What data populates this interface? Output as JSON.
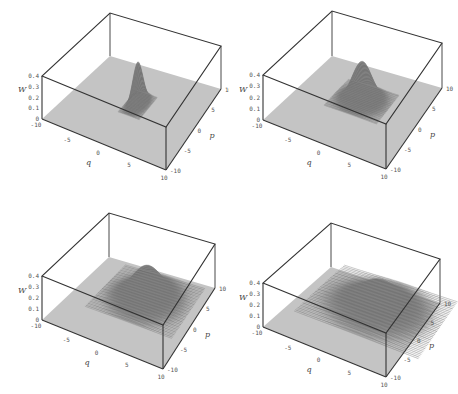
{
  "figure": {
    "panel_count": 4,
    "colors": {
      "floor": "#c4c4c4",
      "peak_dark": "#6e6e6e",
      "peak_mid": "#8a8a8a",
      "edge": "#333333",
      "background": "#ffffff"
    }
  },
  "chart_data": [
    {
      "type": "surface",
      "title": "",
      "xlabel": "q",
      "ylabel": "p",
      "zlabel": "W",
      "xlim": [
        -10,
        10
      ],
      "ylim": [
        -10,
        10
      ],
      "zlim": [
        0,
        0.4
      ],
      "x_ticks": [
        "-10",
        "-5",
        "0",
        "5",
        "10"
      ],
      "y_ticks": [
        "-10",
        "-5",
        "0",
        "5",
        "10"
      ],
      "z_ticks": [
        "0",
        "0.1",
        "0.2",
        "0.3",
        "0.4"
      ],
      "peak": {
        "q": 0,
        "p": 1,
        "height": 0.4,
        "width_q": 0.6,
        "width_p": 1.2,
        "shape": "narrow squeezed ridge"
      },
      "box": {
        "tbl": [
          109,
          16
        ],
        "ltop": [
          36,
          76
        ],
        "tr": [
          221,
          47
        ],
        "ftr": [
          166,
          122
        ],
        "ffr": [
          166,
          170
        ],
        "ffl": [
          42,
          119
        ],
        "fbr": [
          221,
          89
        ],
        "fbl": [
          110,
          56
        ]
      }
    },
    {
      "type": "surface",
      "title": "",
      "xlabel": "q",
      "ylabel": "p",
      "zlabel": "W",
      "xlim": [
        -10,
        10
      ],
      "ylim": [
        -10,
        10
      ],
      "zlim": [
        0,
        0.4
      ],
      "x_ticks": [
        "-10",
        "-5",
        "0",
        "5",
        "10"
      ],
      "y_ticks": [
        "-10",
        "-5",
        "0",
        "5",
        "10"
      ],
      "z_ticks": [
        "0",
        "0.1",
        "0.2",
        "0.3",
        "0.4"
      ],
      "peak": {
        "q": 0,
        "p": 2,
        "height": 0.35,
        "width_q": 1.5,
        "width_p": 1.5,
        "shape": "spiky gaussian"
      },
      "box": {
        "tbl": [
          102,
          15
        ],
        "ltop": [
          29,
          75
        ],
        "tr": [
          213,
          44
        ],
        "ftr": [
          159,
          122
        ],
        "ffr": [
          157,
          169
        ],
        "ffl": [
          34,
          120
        ],
        "fbr": [
          213,
          88
        ],
        "fbl": [
          103,
          56
        ]
      }
    },
    {
      "type": "surface",
      "title": "",
      "xlabel": "q",
      "ylabel": "p",
      "zlabel": "W",
      "xlim": [
        -10,
        10
      ],
      "ylim": [
        -10,
        10
      ],
      "zlim": [
        0,
        0.4
      ],
      "x_ticks": [
        "-10",
        "-5",
        "0",
        "5",
        "10"
      ],
      "y_ticks": [
        "-10",
        "-5",
        "0",
        "5",
        "10"
      ],
      "z_ticks": [
        "0",
        "0.1",
        "0.2",
        "0.3",
        "0.4"
      ],
      "peak": {
        "q": 1,
        "p": 3,
        "height": 0.3,
        "width_q": 2.5,
        "width_p": 2.5,
        "shape": "spiky gaussian"
      },
      "box": {
        "tbl": [
          108,
          18
        ],
        "ltop": [
          36,
          79
        ],
        "tr": [
          221,
          48
        ],
        "ftr": [
          165,
          125
        ],
        "ffr": [
          163,
          172
        ],
        "ffl": [
          42,
          123
        ],
        "fbr": [
          215,
          91
        ],
        "fbl": [
          109,
          60
        ]
      }
    },
    {
      "type": "surface",
      "title": "",
      "xlabel": "q",
      "ylabel": "p",
      "zlabel": "W",
      "xlim": [
        -10,
        10
      ],
      "ylim": [
        -10,
        10
      ],
      "zlim": [
        0,
        0.4
      ],
      "x_ticks": [
        "-10",
        "-5",
        "0",
        "5",
        "10"
      ],
      "y_ticks": [
        "-10",
        "-5",
        "0",
        "5",
        "10"
      ],
      "z_ticks": [
        "0",
        "0.1",
        "0.2",
        "0.3",
        "0.4"
      ],
      "peak": {
        "q": 2,
        "p": 4,
        "height": 0.25,
        "width_q": 3.5,
        "width_p": 3.0,
        "shape": "spiky broad gaussian"
      },
      "box": {
        "tbl": [
          101,
          25
        ],
        "ltop": [
          29,
          86
        ],
        "tr": [
          213,
          65
        ],
        "ftr": [
          158,
          132
        ],
        "ffr": [
          157,
          180
        ],
        "ffl": [
          34,
          130
        ],
        "fbr": [
          211,
          106
        ],
        "fbl": [
          102,
          70
        ]
      }
    }
  ]
}
